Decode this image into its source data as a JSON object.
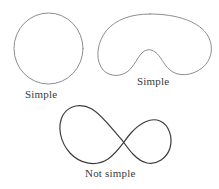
{
  "figure": {
    "background_color": "#ffffff",
    "title": "",
    "shapes": [
      {
        "id": "circle",
        "name": "circle",
        "semantic": "simple-closed-curve",
        "caption": "Simple",
        "stroke_color": "#8d8d8d",
        "stroke_width": 1,
        "bbox": {
          "x": 14,
          "y": 13,
          "width": 69,
          "height": 71
        }
      },
      {
        "id": "bean",
        "name": "kidney-bean-curve",
        "semantic": "simple-closed-curve",
        "caption": "Simple",
        "stroke_color": "#8d8d8d",
        "stroke_width": 1,
        "bbox": {
          "x": 100,
          "y": 14,
          "width": 112,
          "height": 62
        }
      },
      {
        "id": "figure-eight",
        "name": "lemniscate-curve",
        "semantic": "non-simple-closed-curve",
        "caption": "Not simple",
        "stroke_color": "#3c3c3c",
        "stroke_width": 1.2,
        "bbox": {
          "x": 61,
          "y": 105,
          "width": 111,
          "height": 60
        },
        "self_intersection_point": {
          "x": 122,
          "y": 140
        }
      }
    ],
    "captions": {
      "circle_label": "Simple",
      "bean_label": "Simple",
      "eight_label": "Not simple"
    },
    "colors": {
      "light_stroke": "#8d8d8d",
      "dark_stroke": "#3c3c3c",
      "text": "#3a3a3a",
      "background": "#ffffff"
    }
  }
}
